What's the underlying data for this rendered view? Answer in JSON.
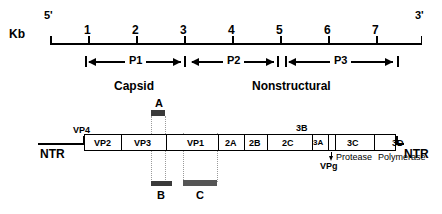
{
  "figure": {
    "type": "picornavirus-genome-organization",
    "axis": {
      "unit_label": "Kb",
      "five_prime": "5'",
      "three_prime": "3'",
      "ticks": [
        "1",
        "2",
        "3",
        "4",
        "5",
        "6",
        "7"
      ],
      "range_kb": [
        0,
        7.6
      ]
    },
    "precursors": [
      {
        "label": "P1",
        "start_kb": 0.72,
        "end_kb": 3.05
      },
      {
        "label": "P2",
        "start_kb": 3.05,
        "end_kb": 5.0
      },
      {
        "label": "P3",
        "start_kb": 5.0,
        "end_kb": 7.35
      }
    ],
    "region_labels": [
      {
        "label": "Capsid"
      },
      {
        "label": "Nonstructural"
      }
    ],
    "genome": {
      "left_ntr": "NTR",
      "right_ntr": "NTR",
      "vp4_label": "VP4",
      "three_b_label": "3B",
      "vpg_label": "VPg",
      "segments": [
        {
          "label": "VP2"
        },
        {
          "label": "VP3"
        },
        {
          "label": "VP1"
        },
        {
          "label": "2A"
        },
        {
          "label": "2B"
        },
        {
          "label": "2C"
        },
        {
          "label": "3A"
        },
        {
          "label": ""
        },
        {
          "label": "3C"
        },
        {
          "label": "3D"
        }
      ],
      "function_labels": [
        {
          "label": "Protease"
        },
        {
          "label": "Polymerase"
        }
      ]
    },
    "probes": [
      {
        "label": "A"
      },
      {
        "label": "B"
      },
      {
        "label": "C"
      }
    ],
    "colors": {
      "line": "#000000",
      "probe_fill": "#555555",
      "guide": "#9a9a9a",
      "background": "#ffffff"
    }
  }
}
